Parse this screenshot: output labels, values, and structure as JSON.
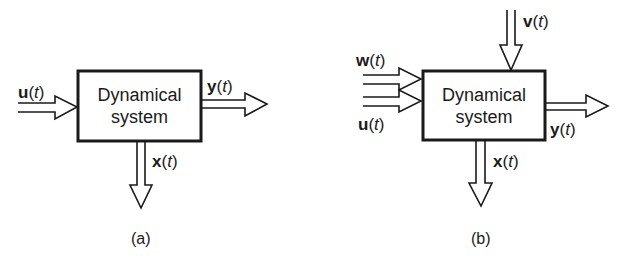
{
  "diagrams": [
    {
      "id": "a",
      "caption": "(a)",
      "block": {
        "line1": "Dynamical",
        "line2": "system"
      },
      "signals": {
        "u": {
          "var": "u",
          "arg": "t"
        },
        "y": {
          "var": "y",
          "arg": "t"
        },
        "x": {
          "var": "x",
          "arg": "t"
        }
      }
    },
    {
      "id": "b",
      "caption": "(b)",
      "block": {
        "line1": "Dynamical",
        "line2": "system"
      },
      "signals": {
        "w": {
          "var": "w",
          "arg": "t"
        },
        "u": {
          "var": "u",
          "arg": "t"
        },
        "v": {
          "var": "v",
          "arg": "t"
        },
        "y": {
          "var": "y",
          "arg": "t"
        },
        "x": {
          "var": "x",
          "arg": "t"
        }
      }
    }
  ],
  "paren_open": "(",
  "paren_close": ")"
}
